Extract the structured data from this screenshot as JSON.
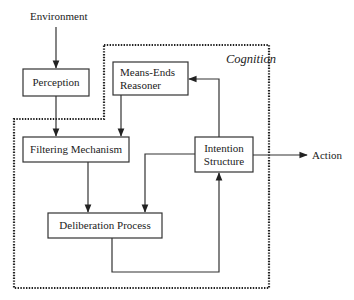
{
  "diagram": {
    "external": {
      "environment": "Environment",
      "action": "Action"
    },
    "region": {
      "label": "Cognition"
    },
    "nodes": {
      "perception": "Perception",
      "means_ends_line1": "Means-Ends",
      "means_ends_line2": "Reasoner",
      "filtering": "Filtering Mechanism",
      "intention_line1": "Intention",
      "intention_line2": "Structure",
      "deliberation": "Deliberation Process"
    },
    "edges": [
      {
        "from": "Environment",
        "to": "Perception"
      },
      {
        "from": "Perception",
        "to": "Filtering Mechanism"
      },
      {
        "from": "Means-Ends Reasoner",
        "to": "Filtering Mechanism"
      },
      {
        "from": "Intention Structure",
        "to": "Means-Ends Reasoner"
      },
      {
        "from": "Filtering Mechanism",
        "to": "Deliberation Process"
      },
      {
        "from": "Intention Structure",
        "to": "Deliberation Process"
      },
      {
        "from": "Deliberation Process",
        "to": "Intention Structure"
      },
      {
        "from": "Intention Structure",
        "to": "Action"
      }
    ],
    "colors": {
      "stroke": "#333333",
      "background": "#ffffff"
    }
  }
}
